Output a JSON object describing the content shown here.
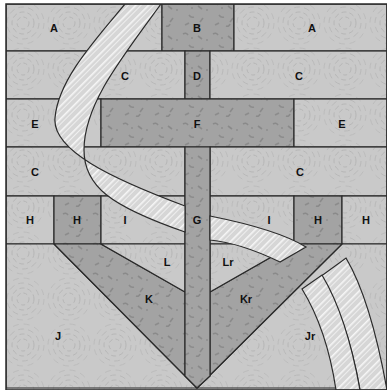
{
  "diagram": {
    "type": "quilt-block-pattern",
    "colors": {
      "light_fabric": "#c9c9c9",
      "light_swirl": "#b4b4b4",
      "dark_fabric": "#a3a3a3",
      "dark_mottle": "#8a8a8a",
      "stripe_base": "#d9d9d9",
      "stripe_line": "#f4f4f4",
      "outline": "#2a2a2a",
      "label": "#111111"
    },
    "labels": {
      "A_left": "A",
      "B": "B",
      "A_right": "A",
      "C_row2_left": "C",
      "D": "D",
      "C_row2_right": "C",
      "E_left": "E",
      "F": "F",
      "E_right": "E",
      "C_row4_left": "C",
      "C_row4_right": "C",
      "H_outer_left": "H",
      "H_inner_left": "H",
      "I_left": "I",
      "G": "G",
      "I_right": "I",
      "H_inner_right": "H",
      "H_outer_right": "H",
      "L": "L",
      "Lr": "Lr",
      "K": "K",
      "Kr": "Kr",
      "J": "J",
      "Jr": "Jr"
    }
  }
}
